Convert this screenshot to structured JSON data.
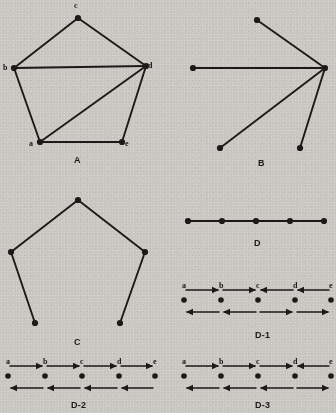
{
  "page": {
    "width": 336,
    "height": 413,
    "background_color": "#c8c6c1",
    "ink_color": "#1b1a18"
  },
  "figures": [
    {
      "id": "A",
      "caption": "A",
      "caption_pos": [
        78,
        155
      ],
      "type": "graph",
      "description": "Pentagon graph on five labelled vertices with one chord",
      "vertices": [
        {
          "id": "a",
          "label": "a",
          "x": 40,
          "y": 142,
          "label_dx": -9,
          "label_dy": 2
        },
        {
          "id": "b",
          "label": "b",
          "x": 14,
          "y": 68,
          "label_dx": -9,
          "label_dy": 0
        },
        {
          "id": "c",
          "label": "c",
          "x": 78,
          "y": 18,
          "label_dx": -2,
          "label_dy": -12
        },
        {
          "id": "d",
          "label": "d",
          "x": 146,
          "y": 66,
          "label_dx": 4,
          "label_dy": 0
        },
        {
          "id": "e",
          "label": "e",
          "x": 122,
          "y": 142,
          "label_dx": 5,
          "label_dy": 2
        }
      ],
      "edges": [
        [
          "b",
          "c"
        ],
        [
          "c",
          "d"
        ],
        [
          "b",
          "d"
        ],
        [
          "a",
          "b"
        ],
        [
          "a",
          "d"
        ],
        [
          "a",
          "e"
        ],
        [
          "d",
          "e"
        ]
      ]
    },
    {
      "id": "B",
      "caption": "B",
      "caption_pos": [
        262,
        158
      ],
      "type": "graph",
      "description": "Star graph: one hub vertex joined to four leaf vertices",
      "vertices": [
        {
          "id": "hub",
          "label": "",
          "x": 325,
          "y": 68
        },
        {
          "id": "n1",
          "label": "",
          "x": 257,
          "y": 20
        },
        {
          "id": "n2",
          "label": "",
          "x": 193,
          "y": 68
        },
        {
          "id": "n3",
          "label": "",
          "x": 220,
          "y": 148
        },
        {
          "id": "n4",
          "label": "",
          "x": 300,
          "y": 148
        }
      ],
      "edges": [
        [
          "hub",
          "n1"
        ],
        [
          "hub",
          "n2"
        ],
        [
          "hub",
          "n3"
        ],
        [
          "hub",
          "n4"
        ]
      ]
    },
    {
      "id": "C",
      "caption": "C",
      "caption_pos": [
        78,
        337
      ],
      "type": "graph",
      "description": "Spanning tree of the pentagon: path of five vertices drawn as an open pentagon",
      "vertices": [
        {
          "id": "v1",
          "label": "",
          "x": 35,
          "y": 323
        },
        {
          "id": "v2",
          "label": "",
          "x": 11,
          "y": 252
        },
        {
          "id": "v3",
          "label": "",
          "x": 78,
          "y": 200
        },
        {
          "id": "v4",
          "label": "",
          "x": 145,
          "y": 252
        },
        {
          "id": "v5",
          "label": "",
          "x": 120,
          "y": 323
        }
      ],
      "edges": [
        [
          "v1",
          "v2"
        ],
        [
          "v2",
          "v3"
        ],
        [
          "v3",
          "v4"
        ],
        [
          "v4",
          "v5"
        ]
      ]
    },
    {
      "id": "D",
      "caption": "D",
      "caption_pos": [
        258,
        238
      ],
      "type": "path",
      "description": "Straight horizontal path with five vertices",
      "y": 221,
      "vertices_x": [
        188,
        222,
        256,
        290,
        324
      ]
    }
  ],
  "traversals": [
    {
      "id": "D-1",
      "caption": "D-1",
      "caption_pos": [
        262,
        330
      ],
      "description": "Path a-b-c-d-e with two rows of traversal arrows",
      "node_labels": [
        "a",
        "b",
        "c",
        "d",
        "e"
      ],
      "nodes_x": [
        184,
        221,
        258,
        295,
        331
      ],
      "top_line_y": 290,
      "dot_row_y": 300,
      "bottom_line_y": 312,
      "top_arrows": [
        "right",
        "right",
        "left",
        "left"
      ],
      "bottom_arrows": [
        "left",
        "left",
        "right",
        "right"
      ]
    },
    {
      "id": "D-2",
      "caption": "D-2",
      "caption_pos": [
        78,
        400
      ],
      "description": "Path a-b-c-d-e, all upper arrows rightward, all lower arrows leftward",
      "node_labels": [
        "a",
        "b",
        "c",
        "d",
        "e"
      ],
      "nodes_x": [
        8,
        45,
        82,
        119,
        155
      ],
      "top_line_y": 366,
      "dot_row_y": 376,
      "bottom_line_y": 388,
      "top_arrows": [
        "right",
        "right",
        "right",
        "right"
      ],
      "bottom_arrows": [
        "left",
        "left",
        "left",
        "left"
      ]
    },
    {
      "id": "D-3",
      "caption": "D-3",
      "caption_pos": [
        262,
        400
      ],
      "description": "Path a-b-c-d-e, upper arrows right-right-right-left, lower arrows left-left-left-right",
      "node_labels": [
        "a",
        "b",
        "c",
        "d",
        "e"
      ],
      "nodes_x": [
        184,
        221,
        258,
        295,
        331
      ],
      "top_line_y": 366,
      "dot_row_y": 376,
      "bottom_line_y": 388,
      "top_arrows": [
        "right",
        "right",
        "right",
        "left"
      ],
      "bottom_arrows": [
        "left",
        "left",
        "left",
        "right"
      ]
    }
  ]
}
